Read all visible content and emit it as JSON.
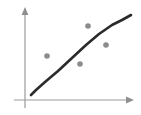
{
  "chart_data": {
    "type": "scatter",
    "title": "",
    "subtitle": "",
    "xlabel": "",
    "ylabel": "",
    "xlim": [
      0,
      10
    ],
    "ylim": [
      0,
      10
    ],
    "grid": false,
    "legend": null,
    "tick_labels": {
      "x": [],
      "y": []
    },
    "annotations": [],
    "point_color": "#8c8c8c",
    "curve_color": "#2b2b2b",
    "axis_color": "#9a9a9a",
    "background_color": "#ffffff",
    "point_radius_px": 2.8,
    "series": [
      {
        "name": "data points",
        "type": "scatter",
        "points": [
          {
            "label": "p1",
            "x": 2.1,
            "y": 5.0,
            "px": 47,
            "py": 56
          },
          {
            "label": "p2",
            "x": 5.2,
            "y": 4.1,
            "px": 80,
            "py": 64
          },
          {
            "label": "p3",
            "x": 6.0,
            "y": 8.2,
            "px": 88,
            "py": 26
          },
          {
            "label": "p4",
            "x": 7.7,
            "y": 6.2,
            "px": 106,
            "py": 45
          }
        ]
      },
      {
        "name": "trend curve",
        "type": "line",
        "path_points_px": [
          {
            "px": 31,
            "py": 95
          },
          {
            "px": 36,
            "py": 90
          },
          {
            "px": 45,
            "py": 82
          },
          {
            "px": 58,
            "py": 71
          },
          {
            "px": 72,
            "py": 58
          },
          {
            "px": 86,
            "py": 45
          },
          {
            "px": 99,
            "py": 34
          },
          {
            "px": 112,
            "py": 25
          },
          {
            "px": 122,
            "py": 20
          },
          {
            "px": 131,
            "py": 15
          }
        ]
      }
    ],
    "axes": {
      "y_axis": {
        "x_px": 25,
        "top_px": 8,
        "bottom_px": 108,
        "arrow": "up"
      },
      "x_axis": {
        "y_px": 100,
        "left_px": 14,
        "right_px": 134,
        "arrow": "right"
      }
    }
  }
}
